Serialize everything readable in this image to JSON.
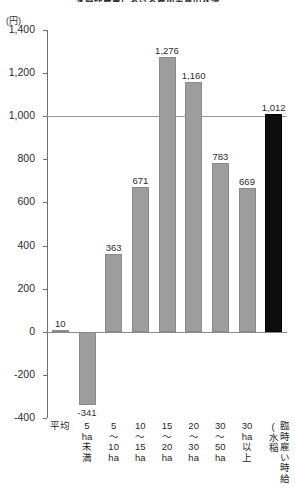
{
  "title": "水稲作農業における雇用労賃の状況",
  "unit_label": "(円)",
  "chart_data": {
    "type": "bar",
    "title": "水稲作農業における雇用労賃の状況",
    "xlabel": "",
    "ylabel": "(円)",
    "ylim": [
      -400,
      1400
    ],
    "yticks": [
      1400,
      1200,
      1000,
      800,
      600,
      400,
      200,
      0,
      -200,
      -400
    ],
    "ytick_labels": [
      "1,400",
      "1,200",
      "1,000",
      "800",
      "600",
      "400",
      "200",
      "0",
      "-200",
      "-400"
    ],
    "grid": false,
    "legend": "none",
    "reference_line": 1000,
    "categories": [
      "平均",
      "5ha未満",
      "5〜10ha",
      "10〜15ha",
      "15〜20ha",
      "20〜30ha",
      "30〜50ha",
      "30ha以上",
      "臨時雇い時給(水稲"
    ],
    "values": [
      10,
      -341,
      363,
      671,
      1276,
      1160,
      783,
      669,
      1012
    ],
    "value_labels": [
      "10",
      "-341",
      "363",
      "671",
      "1,276",
      "1,160",
      "783",
      "669",
      "1,012"
    ],
    "bar_colors": [
      "#9d9d9d",
      "#9d9d9d",
      "#9d9d9d",
      "#9d9d9d",
      "#9d9d9d",
      "#9d9d9d",
      "#9d9d9d",
      "#9d9d9d",
      "#0d0d0d"
    ]
  },
  "axis": {
    "ticks": [
      {
        "label": "1,400"
      },
      {
        "label": "1,200"
      },
      {
        "label": "1,000"
      },
      {
        "label": "800"
      },
      {
        "label": "600"
      },
      {
        "label": "400"
      },
      {
        "label": "200"
      },
      {
        "label": "0"
      },
      {
        "label": "-200"
      },
      {
        "label": "-400"
      }
    ]
  },
  "xcategories": [
    {
      "lines": [
        "平均"
      ],
      "vertical": false
    },
    {
      "lines": [
        "5",
        "ha",
        "未",
        "満"
      ],
      "vertical": false
    },
    {
      "lines": [
        "5",
        "〜",
        "10",
        "ha"
      ],
      "vertical": false
    },
    {
      "lines": [
        "10",
        "〜",
        "15",
        "ha"
      ],
      "vertical": false
    },
    {
      "lines": [
        "15",
        "〜",
        "20",
        "ha"
      ],
      "vertical": false
    },
    {
      "lines": [
        "20",
        "〜",
        "30",
        "ha"
      ],
      "vertical": false
    },
    {
      "lines": [
        "30",
        "〜",
        "50",
        "ha"
      ],
      "vertical": false
    },
    {
      "lines": [
        "30",
        "ha",
        "以",
        "上"
      ],
      "vertical": false
    },
    {
      "lines": [
        "臨時雇い時給(水稲"
      ],
      "vertical": true
    }
  ]
}
